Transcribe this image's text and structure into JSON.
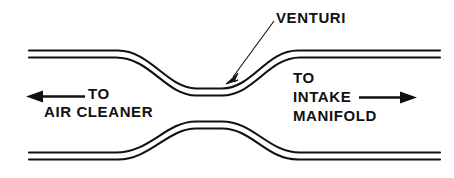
{
  "diagram": {
    "background_color": "#ffffff",
    "line_color": "#111111",
    "width": 454,
    "height": 178,
    "labels": {
      "venturi": "VENTURI",
      "to_left": "TO",
      "air_cleaner": "AIR CLEANER",
      "to_right": "TO",
      "intake": "INTAKE",
      "manifold": "MANIFOLD"
    },
    "icons": {
      "left_arrow": "left-arrow-icon",
      "right_arrow": "right-arrow-icon",
      "leader_arrow": "leader-arrow-icon"
    },
    "flow": {
      "left_direction": "left",
      "right_direction": "right"
    }
  }
}
